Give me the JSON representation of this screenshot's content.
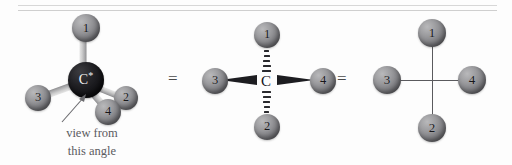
{
  "figure": {
    "equals_symbol": "=",
    "background_color": "#fdfdfd",
    "rule_color": "#d7d7d7"
  },
  "annotation": {
    "line1": "view from",
    "line2": "this angle",
    "color": "#5b5b5f"
  },
  "center_atom": {
    "label": "C",
    "stereocenter_mark": "*",
    "color_3d": "#121215",
    "color_2d": "#141418"
  },
  "substituents": [
    {
      "id": "1",
      "label": "1"
    },
    {
      "id": "2",
      "label": "2"
    },
    {
      "id": "3",
      "label": "3"
    },
    {
      "id": "4",
      "label": "4"
    }
  ],
  "models": {
    "ball_and_stick": {
      "name": "ball-and-stick tetrahedral model",
      "atoms": [
        {
          "label": "1",
          "x": 86,
          "y": 28,
          "r": 14
        },
        {
          "label": "2",
          "x": 126,
          "y": 98,
          "r": 12
        },
        {
          "label": "3",
          "x": 38,
          "y": 98,
          "r": 13
        },
        {
          "label": "4",
          "x": 108,
          "y": 112,
          "r": 13
        }
      ],
      "center": {
        "label": "C",
        "x": 86,
        "y": 80,
        "r": 18
      }
    },
    "wedge_dash": {
      "name": "wedge-and-dash projection",
      "center_label": "C",
      "atoms": [
        {
          "label": "1",
          "x": 269,
          "y": 35,
          "r": 13
        },
        {
          "label": "2",
          "x": 269,
          "y": 127,
          "r": 13
        },
        {
          "label": "3",
          "x": 215,
          "y": 81,
          "r": 13
        },
        {
          "label": "4",
          "x": 323,
          "y": 81,
          "r": 13
        }
      ],
      "bond_styles": {
        "left": "wedge",
        "right": "wedge",
        "up": "hash",
        "down": "hash"
      },
      "hash_count": 7
    },
    "line_drawing": {
      "name": "plain line cross projection",
      "atoms": [
        {
          "label": "1",
          "x": 432,
          "y": 33,
          "r": 14
        },
        {
          "label": "2",
          "x": 432,
          "y": 128,
          "r": 14
        },
        {
          "label": "3",
          "x": 387,
          "y": 80,
          "r": 14
        },
        {
          "label": "4",
          "x": 472,
          "y": 80,
          "r": 14
        }
      ],
      "bond_styles": {
        "left": "plain",
        "right": "plain",
        "up": "plain",
        "down": "plain"
      }
    }
  }
}
